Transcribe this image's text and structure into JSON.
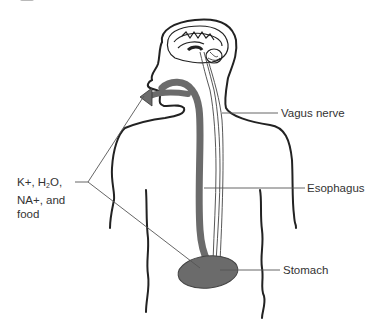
{
  "diagram": {
    "labels": {
      "vagus_nerve": "Vagus nerve",
      "esophagus": "Esophagus",
      "stomach": "Stomach",
      "inputs": {
        "line1_pre": "K+, H",
        "line1_sub": "2",
        "line1_post": "O,",
        "line2": "NA+, and",
        "line3": "food"
      }
    },
    "colors": {
      "outline": "#222222",
      "organ_fill": "#6b6b6b",
      "leader_line": "#555555",
      "background": "#ffffff"
    }
  }
}
